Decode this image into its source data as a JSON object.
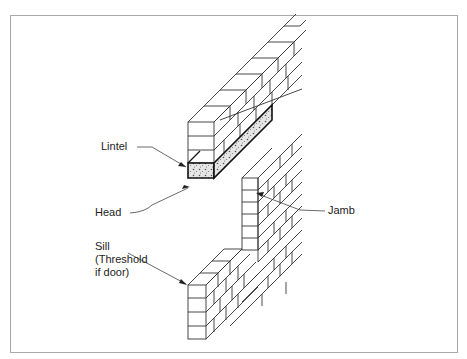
{
  "diagram": {
    "type": "isometric wall opening drawing",
    "labels": {
      "lintel": "Lintel",
      "head": "Head",
      "jamb": "Jamb",
      "sill_line1": "Sill",
      "sill_line2": "(Threshold",
      "sill_line3": "if door)"
    },
    "colors": {
      "line": "#333333",
      "frame": "#a8a8a8",
      "lintel_fill": "#d8d8d8"
    }
  }
}
